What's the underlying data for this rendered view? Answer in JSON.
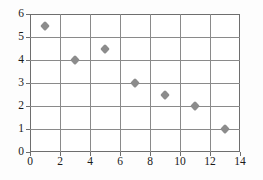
{
  "chart_data": {
    "type": "scatter",
    "title": "",
    "xlabel": "",
    "ylabel": "",
    "xlim": [
      0,
      14
    ],
    "ylim": [
      0,
      6
    ],
    "xticks": [
      0,
      2,
      4,
      6,
      8,
      10,
      12,
      14
    ],
    "yticks": [
      0,
      1,
      2,
      3,
      4,
      5,
      6
    ],
    "grid": true,
    "legend": null,
    "marker_style": "diamond",
    "marker_color": "#8c8c8c",
    "grid_color": "#8a8a8a",
    "axis_color": "#6e6e6e",
    "background_color": "#ffffff",
    "points": [
      {
        "x": 1,
        "y": 5.5
      },
      {
        "x": 3,
        "y": 4
      },
      {
        "x": 5,
        "y": 4.5
      },
      {
        "x": 7,
        "y": 3
      },
      {
        "x": 9,
        "y": 2.5
      },
      {
        "x": 11,
        "y": 2
      },
      {
        "x": 13,
        "y": 1
      }
    ]
  }
}
